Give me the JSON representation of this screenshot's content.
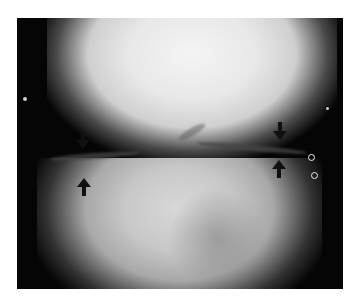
{
  "image": {
    "subject": "Knee radiograph (frontal view) showing joint space",
    "annotations": [
      {
        "type": "arrow",
        "direction": "down",
        "label": "medial-upper-arrow"
      },
      {
        "type": "arrow",
        "direction": "up",
        "label": "medial-lower-arrow"
      },
      {
        "type": "arrow",
        "direction": "down",
        "label": "lateral-upper-arrow"
      },
      {
        "type": "arrow",
        "direction": "up",
        "label": "lateral-lower-arrow"
      }
    ],
    "markers": [
      "dot-left",
      "dot-right",
      "ring-upper-right",
      "ring-lower-right"
    ],
    "colors": {
      "background": "#ffffff",
      "film_dark": "#050505",
      "bone_light": "#f0f0f0",
      "arrow": "#111111"
    }
  }
}
